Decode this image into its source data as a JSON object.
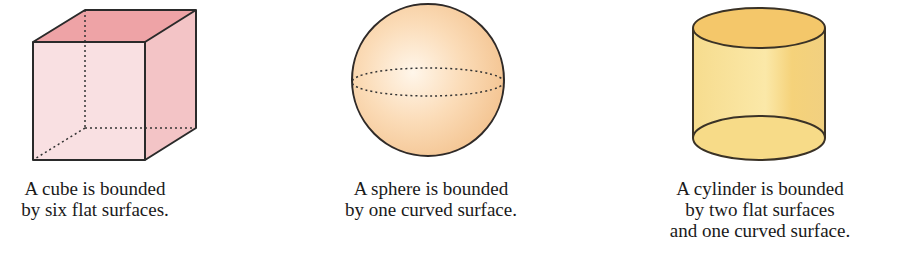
{
  "figures": [
    {
      "shape": "cube",
      "caption_lines": [
        "A cube is bounded",
        "by six flat surfaces."
      ],
      "fill": "#f7d9dc",
      "top_fill": "#eea3a6",
      "side_fill": "#f3c4c6"
    },
    {
      "shape": "sphere",
      "caption_lines": [
        "A sphere is bounded",
        "by one curved surface."
      ],
      "fill": "#f9d9b4",
      "highlight": "#fff4e6"
    },
    {
      "shape": "cylinder",
      "caption_lines": [
        "A cylinder is bounded",
        "by two flat surfaces",
        "and one curved surface."
      ],
      "fill": "#f8df90",
      "top_fill": "#f4c76a"
    }
  ]
}
